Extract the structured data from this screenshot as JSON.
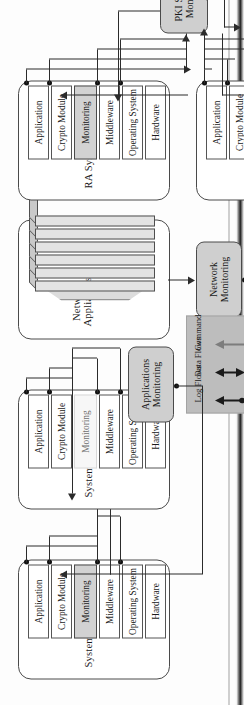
{
  "diagram": {
    "layer_names": [
      "Application",
      "Crypto Module",
      "Monitoring",
      "Middleware",
      "Operating System",
      "Hardware"
    ],
    "systems": [
      {
        "id": "system-b",
        "name": "System B",
        "monitoring_state": "active"
      },
      {
        "id": "system-a",
        "name": "System A",
        "monitoring_state": "inactive"
      },
      {
        "id": "ra-system",
        "name": "RA System",
        "monitoring_state": "active"
      },
      {
        "id": "ca-system",
        "name": "CA  System",
        "monitoring_state": "active"
      }
    ],
    "network_appliances": {
      "id": "network-appliances",
      "name_line1": "Network",
      "name_line2": "Appliances",
      "slab_count": 6
    },
    "monitors": [
      {
        "id": "applications-monitoring",
        "line1": "Applications",
        "line2": "Monitoring"
      },
      {
        "id": "network-monitoring",
        "line1": "Network",
        "line2": "Monitoring"
      },
      {
        "id": "pki-systems-monitoring",
        "line1": "PKI Systems",
        "line2": "Monitoring"
      }
    ],
    "legend": {
      "id": "flow-legend",
      "items": [
        {
          "label": "Log Flows",
          "style": "log"
        },
        {
          "label": "Data Flows",
          "style": "data"
        },
        {
          "label": "Command",
          "style": "command"
        }
      ]
    },
    "operator_terminals": [
      {
        "id": "operator-workstation",
        "kind": "desktop-computer-icon"
      },
      {
        "id": "operator-display",
        "kind": "monitor-icon"
      }
    ],
    "colors": {
      "monitoring_active": "#d2d2d2",
      "monitoring_inactive": "#f7f7f7",
      "monitor_box": "#cfcfcf",
      "legend_bg": "#bdbdbd",
      "line": "#2b2b2b",
      "command_line": "#7d7d7d"
    }
  }
}
